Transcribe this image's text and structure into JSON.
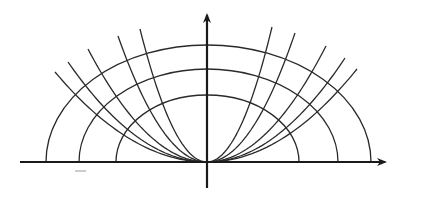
{
  "diagram": {
    "colors": {
      "line": "#2a2a2a",
      "axis": "#1a1a1a",
      "background": "#ffffff"
    },
    "origin": [
      207,
      162
    ],
    "x_axis": {
      "from": [
        20,
        162
      ],
      "to": [
        385,
        162
      ],
      "arrow": "right"
    },
    "y_axis": {
      "from": [
        207,
        188
      ],
      "to": [
        207,
        15
      ],
      "arrow": "up"
    },
    "ellipses": [
      {
        "name": "outer",
        "rx_left": 161,
        "rx_right": 164,
        "ry": 117
      },
      {
        "name": "middle",
        "rx_left": 128,
        "rx_right": 131,
        "ry": 93
      },
      {
        "name": "inner",
        "rx_left": 91,
        "rx_right": 92,
        "ry": 67
      }
    ],
    "parabolas_left_tips": [
      [
        55,
        72
      ],
      [
        68,
        62
      ],
      [
        88,
        49
      ],
      [
        118,
        36
      ],
      [
        140,
        29
      ]
    ],
    "parabolas_right_tips": [
      [
        272,
        27
      ],
      [
        295,
        33
      ],
      [
        326,
        46
      ],
      [
        345,
        58
      ],
      [
        357,
        69
      ]
    ],
    "marks": [
      {
        "type": "dash",
        "from": [
          75,
          171
        ],
        "to": [
          86,
          171
        ]
      }
    ]
  }
}
